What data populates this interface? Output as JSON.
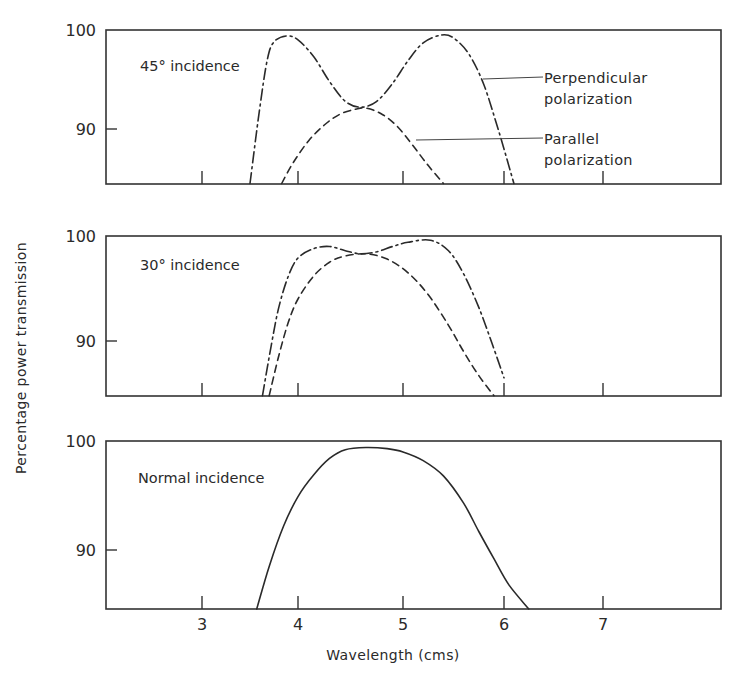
{
  "chart_data": {
    "type": "line",
    "xlabel": "Wavelength (cms)",
    "ylabel": "Percentage power transmission",
    "x_ticks": [
      3,
      4,
      5,
      6,
      7
    ],
    "xlim": [
      2.04,
      8.2
    ],
    "panels": [
      {
        "id": "45deg",
        "label": "45° incidence",
        "ylim": [
          84.5,
          100
        ],
        "y_ticks": [
          90,
          100
        ],
        "grid": false,
        "annotations": [
          {
            "text_lines": [
              "Perpendicular",
              "polarization"
            ],
            "points_to": "perpendicular"
          },
          {
            "text_lines": [
              "Parallel",
              "polarization"
            ],
            "points_to": "parallel"
          }
        ],
        "series": [
          {
            "name": "Perpendicular polarization",
            "style": "dash-dot",
            "x": [
              3.5,
              3.6,
              3.68,
              3.75,
              3.88,
              4.0,
              4.15,
              4.3,
              4.45,
              4.6,
              4.75,
              4.9,
              5.05,
              5.2,
              5.38,
              5.5,
              5.65,
              5.8,
              5.95,
              6.1
            ],
            "y": [
              84.5,
              92.0,
              97.0,
              98.8,
              99.4,
              99.0,
              97.3,
              94.8,
              92.8,
              92.2,
              92.8,
              94.6,
              96.9,
              98.7,
              99.5,
              99.2,
              97.6,
              94.5,
              89.7,
              84.5
            ]
          },
          {
            "name": "Parallel polarization",
            "style": "dashed",
            "x": [
              3.83,
              3.95,
              4.1,
              4.25,
              4.4,
              4.55,
              4.65,
              4.8,
              4.95,
              5.1,
              5.25,
              5.4
            ],
            "y": [
              84.5,
              86.6,
              88.8,
              90.4,
              91.5,
              92.0,
              92.1,
              91.5,
              90.2,
              88.3,
              86.3,
              84.5
            ]
          }
        ]
      },
      {
        "id": "30deg",
        "label": "30° incidence",
        "ylim": [
          84.8,
          100
        ],
        "y_ticks": [
          90,
          100
        ],
        "grid": false,
        "series": [
          {
            "name": "Perpendicular polarization",
            "style": "dash-dot",
            "x": [
              3.63,
              3.72,
              3.8,
              3.9,
              4.0,
              4.15,
              4.3,
              4.45,
              4.6,
              4.75,
              4.9,
              5.05,
              5.27,
              5.45,
              5.6,
              5.75,
              5.88,
              6.0
            ],
            "y": [
              84.8,
              89.5,
              93.2,
              96.2,
              97.9,
              98.8,
              99.0,
              98.6,
              98.3,
              98.5,
              99.0,
              99.4,
              99.6,
              98.6,
              96.4,
              93.2,
              89.8,
              86.5
            ]
          },
          {
            "name": "Parallel polarization",
            "style": "dashed",
            "x": [
              3.7,
              3.8,
              3.9,
              4.0,
              4.15,
              4.3,
              4.45,
              4.65,
              4.85,
              5.05,
              5.25,
              5.45,
              5.6,
              5.75,
              5.9
            ],
            "y": [
              84.8,
              88.6,
              91.8,
              94.0,
              96.2,
              97.5,
              98.1,
              98.3,
              97.8,
              96.5,
              94.4,
              91.5,
              89.0,
              86.7,
              84.8
            ]
          }
        ]
      },
      {
        "id": "normal",
        "label": "Normal incidence",
        "ylim": [
          84.5,
          100
        ],
        "y_ticks": [
          90,
          100
        ],
        "grid": false,
        "series": [
          {
            "name": "Normal incidence",
            "style": "solid",
            "x": [
              3.57,
              3.7,
              3.85,
              4.0,
              4.15,
              4.3,
              4.45,
              4.65,
              4.85,
              5.0,
              5.2,
              5.4,
              5.6,
              5.75,
              5.9,
              6.05,
              6.25
            ],
            "y": [
              84.5,
              88.5,
              92.2,
              94.9,
              96.9,
              98.4,
              99.2,
              99.4,
              99.3,
              99.0,
              98.2,
              96.8,
              94.3,
              91.7,
              89.2,
              86.8,
              84.5
            ]
          }
        ]
      }
    ]
  },
  "labels": {
    "ylabel": "Percentage power transmission",
    "xlabel": "Wavelength (cms)",
    "panel1": "45° incidence",
    "panel2": "30° incidence",
    "panel3": "Normal incidence",
    "perp_line1": "Perpendicular",
    "perp_line2": "polarization",
    "par_line1": "Parallel",
    "par_line2": "polarization",
    "y100": "100",
    "y90": "90",
    "x3": "3",
    "x4": "4",
    "x5": "5",
    "x6": "6",
    "x7": "7"
  },
  "colors": {
    "ink": "#2a2a2a",
    "background": "#ffffff"
  }
}
